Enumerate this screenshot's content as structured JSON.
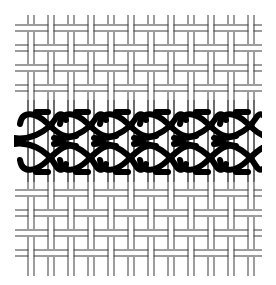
{
  "diagram": {
    "type": "embroidery-stitch-diagram",
    "canvas": {
      "x_start": 15,
      "x_end": 262,
      "y_start": 15,
      "y_end": 276,
      "column_period": 20,
      "column_pair_offsets": [
        13,
        19
      ],
      "first_column_x": 15,
      "row_period": 20,
      "weft_rows_top": [
        25,
        45,
        65,
        85
      ],
      "weft_rows_bottom": [
        190,
        210,
        230,
        250
      ],
      "weft_thickness": 6,
      "thread_color": "#333333"
    },
    "stitch_band": {
      "repeats": 6,
      "repeat_width": 40,
      "x_start": 18,
      "upper_row_y": [
        112,
        138
      ],
      "lower_row_y": [
        144,
        172
      ],
      "stroke_width": 6,
      "color": "#000000"
    },
    "colors": {
      "background": "#ffffff",
      "thread": "#3a3a3a",
      "stitch": "#000000"
    }
  }
}
